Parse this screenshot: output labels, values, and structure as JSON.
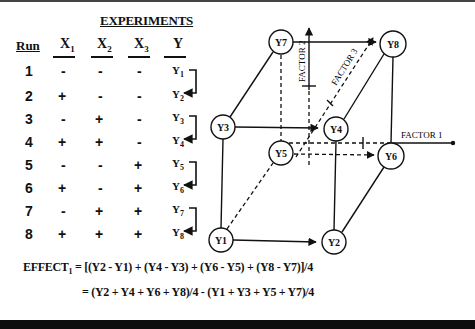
{
  "title": "EXPERIMENTS",
  "table": {
    "headers": {
      "run": "Run",
      "x1": "X",
      "x1_sub": "1",
      "x2": "X",
      "x2_sub": "2",
      "x3": "X",
      "x3_sub": "3",
      "y": "Y"
    },
    "rows": [
      {
        "run": "1",
        "x1": "-",
        "x2": "-",
        "x3": "-",
        "y": "Y",
        "y_sub": "1"
      },
      {
        "run": "2",
        "x1": "+",
        "x2": "-",
        "x3": "-",
        "y": "Y",
        "y_sub": "2"
      },
      {
        "run": "3",
        "x1": "-",
        "x2": "+",
        "x3": "-",
        "y": "Y",
        "y_sub": "3"
      },
      {
        "run": "4",
        "x1": "+",
        "x2": "+",
        "x3": "-",
        "y": "Y",
        "y_sub": "4"
      },
      {
        "run": "5",
        "x1": "-",
        "x2": "-",
        "x3": "+",
        "y": "Y",
        "y_sub": "5"
      },
      {
        "run": "6",
        "x1": "+",
        "x2": "-",
        "x3": "+",
        "y": "Y",
        "y_sub": "6"
      },
      {
        "run": "7",
        "x1": "-",
        "x2": "+",
        "x3": "+",
        "y": "Y",
        "y_sub": "7"
      },
      {
        "run": "8",
        "x1": "+",
        "x2": "+",
        "x3": "+",
        "y": "Y",
        "y_sub": "8"
      }
    ]
  },
  "cube": {
    "nodes": {
      "y1": "Y1",
      "y2": "Y2",
      "y3": "Y3",
      "y4": "Y4",
      "y5": "Y5",
      "y6": "Y6",
      "y7": "Y7",
      "y8": "Y8"
    },
    "axes": {
      "factor1": "FACTOR 1",
      "factor2": "FACTOR 2",
      "factor3": "FACTOR 3"
    }
  },
  "equations": {
    "line1": {
      "lhs": "EFFECT",
      "lhs_sub": "1",
      "text": "= [(Y2 - Y1) + (Y4 - Y3) + (Y6 - Y5) + (Y8 - Y7)]/4"
    },
    "line2": {
      "text": "= (Y2 + Y4 + Y6 + Y8)/4 - (Y1 + Y3 + Y5 + Y7)/4"
    }
  }
}
